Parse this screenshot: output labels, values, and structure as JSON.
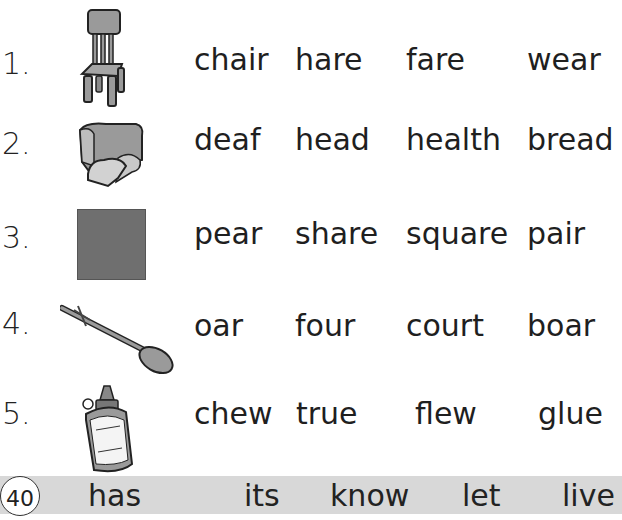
{
  "rows": [
    {
      "number": "1.",
      "picture": "chair",
      "words": [
        "chair",
        "hare",
        "fare",
        "wear"
      ]
    },
    {
      "number": "2.",
      "picture": "bread",
      "words": [
        "deaf",
        "head",
        "health",
        "bread"
      ]
    },
    {
      "number": "3.",
      "picture": "square",
      "words": [
        "pear",
        "share",
        "square",
        "pair"
      ]
    },
    {
      "number": "4.",
      "picture": "oar",
      "words": [
        "oar",
        "four",
        "court",
        "boar"
      ]
    },
    {
      "number": "5.",
      "picture": "glue",
      "words": [
        "chew",
        "true",
        "flew",
        "glue"
      ]
    }
  ],
  "footer": {
    "page_number": "40",
    "sight_words": [
      "has",
      "its",
      "know",
      "let",
      "live"
    ]
  },
  "colors": {
    "square_fill": "#6f6f6f",
    "footer_bar": "#d8d8d8",
    "picture_gray": "#9a9a9a"
  }
}
